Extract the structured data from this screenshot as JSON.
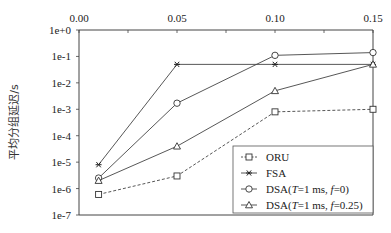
{
  "chart_data": {
    "type": "line",
    "title": "",
    "xlabel": "",
    "ylabel": "平均分组延迟/s",
    "x_axis_position": "top",
    "xlim": [
      0.0,
      0.15
    ],
    "ylim": [
      1e-07,
      1.0
    ],
    "yscale": "log",
    "x_ticks": [
      "0.00",
      "0.05",
      "0.10",
      "0.15"
    ],
    "y_ticks": [
      "1e+0",
      "1e-1",
      "1e-2",
      "1e-3",
      "1e-4",
      "1e-5",
      "1e-6",
      "1e-7"
    ],
    "grid": false,
    "legend_position": "lower right",
    "x": [
      0.01,
      0.05,
      0.1,
      0.15
    ],
    "series": [
      {
        "name": "ORU",
        "marker": "square",
        "linestyle": "dashed",
        "values": [
          6e-07,
          3e-06,
          0.0008,
          0.001
        ]
      },
      {
        "name": "FSA",
        "marker": "asterisk",
        "linestyle": "solid",
        "values": [
          8e-06,
          0.05,
          0.05,
          0.05
        ]
      },
      {
        "name": "DSA(T=1 ms, f=0)",
        "marker": "circle",
        "linestyle": "solid",
        "values": [
          2.5e-06,
          0.0017,
          0.11,
          0.14
        ]
      },
      {
        "name": "DSA(T=1 ms, f=0.25)",
        "marker": "triangle",
        "linestyle": "solid",
        "values": [
          2e-06,
          4e-05,
          0.005,
          0.05
        ]
      }
    ]
  },
  "legend": {
    "items": [
      {
        "label": "ORU"
      },
      {
        "label": "FSA"
      },
      {
        "label_pre": "DSA(",
        "T": "T",
        "mid1": "=1 ms, ",
        "f": "f",
        "mid2": "=0)"
      },
      {
        "label_pre": "DSA(",
        "T": "T",
        "mid1": "=1 ms, ",
        "f": "f",
        "mid2": "=0.25)"
      }
    ]
  }
}
